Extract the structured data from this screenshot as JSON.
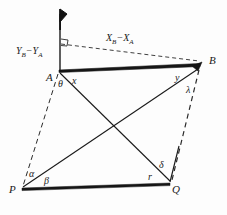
{
  "figure": {
    "kind": "surveying-triangulation-diagram",
    "background_color": "#fdfdfd",
    "line_color": "#1a1a1a",
    "labels": {
      "point_a": "A",
      "point_b": "B",
      "point_p": "P",
      "point_q": "Q",
      "delta_x": "X",
      "delta_x_sub1": "B",
      "delta_x_minus": "−X",
      "delta_x_sub2": "A",
      "delta_y": "Y",
      "delta_y_sub1": "B",
      "delta_y_minus": "−Y",
      "delta_y_sub2": "A",
      "angle_theta": "θ",
      "angle_x": "x",
      "angle_y": "y",
      "angle_lambda": "λ",
      "angle_alpha": "α",
      "angle_beta": "β",
      "angle_gamma": "r",
      "angle_delta": "δ"
    },
    "geometry": {
      "a": [
        59,
        70
      ],
      "b": [
        200,
        63
      ],
      "p": [
        22,
        188
      ],
      "q": [
        170,
        183
      ],
      "north_arrow_top": [
        60,
        8
      ],
      "north_arrow_base": [
        60,
        70
      ],
      "right_angle_corner": [
        60,
        46
      ],
      "dashed_corner": [
        60,
        44
      ]
    },
    "elements": {
      "north_arrow": "north-arrow-icon",
      "right_angle_marker": "right-angle-marker-icon",
      "baseline_ab": "thick-baseline-ab",
      "dashed_ap": "dashed-line-a-p",
      "dashed_bq": "dashed-line-b-q",
      "dashed_delta_x": "dashed-line-delta-x",
      "solid_aq": "solid-line-a-q",
      "solid_bp": "solid-line-b-p",
      "solid_pq": "thick-line-p-q"
    }
  }
}
